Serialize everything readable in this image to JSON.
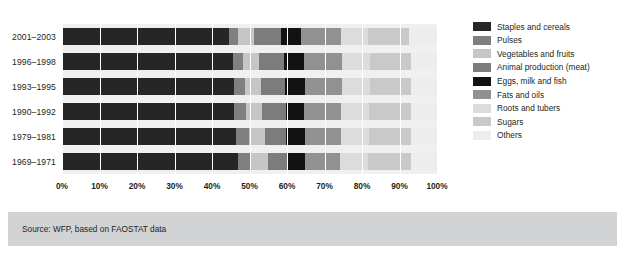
{
  "chart_data": {
    "type": "bar",
    "orientation": "horizontal",
    "stacked": true,
    "normalized": "100%",
    "title": "",
    "subtitle": "",
    "xlabel": "",
    "ylabel": "",
    "xlim": [
      0,
      100
    ],
    "grid": true,
    "legend_position": "right",
    "xticks": [
      "0%",
      "10%",
      "20%",
      "30%",
      "40%",
      "50%",
      "60%",
      "70%",
      "80%",
      "90%",
      "100%"
    ],
    "xtick_values": [
      0,
      10,
      20,
      30,
      40,
      50,
      60,
      70,
      80,
      90,
      100
    ],
    "categories": [
      "2001–2003",
      "1996–1998",
      "1993–1995",
      "1990–1992",
      "1979–1981",
      "1969–1971"
    ],
    "series": [
      {
        "name": "Staples and cereals",
        "color": "#262626",
        "values": [
          44.5,
          45.5,
          45.8,
          45.8,
          46.5,
          47.0
        ]
      },
      {
        "name": "Pulses",
        "color": "#808080",
        "values": [
          2.5,
          2.8,
          3.0,
          3.2,
          3.3,
          3.5
        ]
      },
      {
        "name": "Vegetables and fruits",
        "color": "#c6c6c6",
        "values": [
          4.2,
          4.2,
          4.2,
          4.4,
          4.4,
          4.4
        ]
      },
      {
        "name": "Animal production (meat)",
        "color": "#7c7c7c",
        "values": [
          7.3,
          6.8,
          6.5,
          6.2,
          5.6,
          5.0
        ]
      },
      {
        "name": "Eggs, milk and fish",
        "color": "#121212",
        "values": [
          5.3,
          5.2,
          5.2,
          5.0,
          5.0,
          5.0
        ]
      },
      {
        "name": "Fats and oils",
        "color": "#919191",
        "values": [
          10.5,
          10.2,
          10.0,
          9.8,
          9.5,
          9.3
        ]
      },
      {
        "name": "Roots and tubers",
        "color": "#dcdcdc",
        "values": [
          7.4,
          7.3,
          7.3,
          7.4,
          7.5,
          7.5
        ]
      },
      {
        "name": "Sugars",
        "color": "#c9c9c9",
        "values": [
          10.8,
          11.0,
          11.0,
          11.2,
          11.2,
          11.3
        ]
      },
      {
        "name": "Others",
        "color": "#ededed",
        "values": [
          7.5,
          7.0,
          7.0,
          7.0,
          7.0,
          7.0
        ]
      }
    ]
  },
  "legend": {
    "items": [
      {
        "label": "Staples and cereals",
        "color": "#262626"
      },
      {
        "label": "Pulses",
        "color": "#808080"
      },
      {
        "label": "Vegetables and fruits",
        "color": "#c6c6c6"
      },
      {
        "label": "Animal production (meat)",
        "color": "#7c7c7c"
      },
      {
        "label": "Eggs, milk and fish",
        "color": "#121212"
      },
      {
        "label": "Fats and oils",
        "color": "#919191"
      },
      {
        "label": "Roots and tubers",
        "color": "#dcdcdc"
      },
      {
        "label": "Sugars",
        "color": "#c9c9c9"
      },
      {
        "label": "Others",
        "color": "#ededed"
      }
    ]
  },
  "footer": {
    "source": "Source: WFP, based on FAOSTAT data",
    "band_color": "#d2d3d5"
  },
  "style": {
    "row_background": "#f0f0f0",
    "page_background": "#ffffff",
    "text_color": "#231f20"
  }
}
